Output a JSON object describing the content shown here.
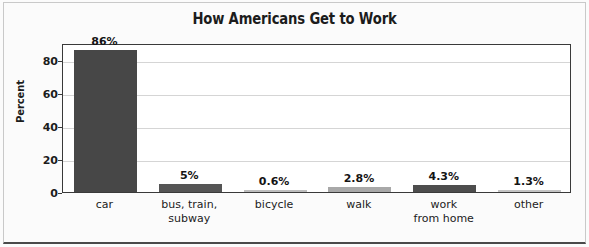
{
  "chart_data": {
    "type": "bar",
    "title": "How Americans Get to Work",
    "xlabel": "",
    "ylabel": "Percent",
    "ylim": [
      0,
      90
    ],
    "yticks": [
      0,
      20,
      40,
      60,
      80
    ],
    "ytick_labels": [
      "0",
      "20",
      "40",
      "60",
      "80"
    ],
    "grid": true,
    "legend": "none",
    "categories": [
      "car",
      "bus, train, subway",
      "bicycle",
      "walk",
      "work from home",
      "other"
    ],
    "category_lines": [
      [
        "car"
      ],
      [
        "bus, train,",
        "subway"
      ],
      [
        "bicycle"
      ],
      [
        "walk"
      ],
      [
        "work",
        "from home"
      ],
      [
        "other"
      ]
    ],
    "values": [
      86,
      5,
      0.6,
      2.8,
      4.3,
      1.3
    ],
    "value_labels": [
      "86%",
      "5%",
      "0.6%",
      "2.8%",
      "4.3%",
      "1.3%"
    ],
    "bar_colors": [
      "#474747",
      "#555555",
      "#bdbdbd",
      "#a8a8a8",
      "#4d4d4d",
      "#c4c4c4"
    ]
  },
  "colors": {
    "figure_background": "#fbfbfb",
    "plot_background": "#ffffff",
    "axis": "#3a3a3a",
    "gridline": "#d5d5d5",
    "text": "#1c1c1c"
  }
}
